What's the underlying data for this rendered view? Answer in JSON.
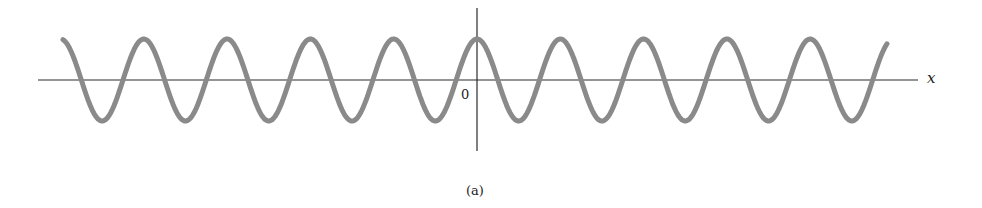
{
  "chart_data": {
    "type": "line",
    "title": "",
    "caption": "(a)",
    "xlabel": "x",
    "ylabel": "",
    "origin_label": "0",
    "function": "cosine",
    "series": [
      {
        "name": "wave",
        "color": "#8a8a8a",
        "amplitude_px": 41,
        "period_px": 83.3,
        "phase": "maximum at x = 0",
        "x_range_periods": [
          -4.97,
          4.93
        ]
      }
    ],
    "axes": {
      "horizontal": {
        "from_px": 38,
        "to_px": 918,
        "y_px": 80
      },
      "vertical": {
        "x_px": 477,
        "from_px": 8,
        "to_px": 151
      }
    },
    "grid": false,
    "legend": null,
    "ticks": []
  },
  "labels": {
    "x_axis": "x",
    "origin": "0",
    "caption": "(a)"
  },
  "colors": {
    "wave": "#8a8a8a",
    "axis": "#2b2b2b",
    "background": "#ffffff"
  }
}
